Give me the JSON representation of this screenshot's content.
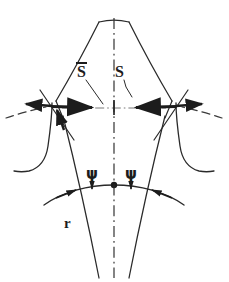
{
  "figure": {
    "kind": "engineering-line-drawing",
    "background_color": "#ffffff",
    "ink_color": "#1c1c1c",
    "width": 229,
    "height": 282
  },
  "labels": {
    "s_bar": "S",
    "s_bar_has_overbar": true,
    "s": "S",
    "radius": "r",
    "psi_left": "ψ",
    "psi_right": "ψ"
  },
  "annotations": [
    {
      "name": "s-bar-dimension",
      "symbol": "S̄",
      "side": "left",
      "description": "Tooth thickness measured left of centerline"
    },
    {
      "name": "s-dimension",
      "symbol": "S",
      "side": "right",
      "description": "Tooth thickness measured right of centerline"
    },
    {
      "name": "psi-angle-left",
      "symbol": "ψ",
      "side": "left",
      "description": "Angle marker at pitch arc, left of centerline"
    },
    {
      "name": "psi-angle-right",
      "symbol": "ψ",
      "side": "right",
      "description": "Angle marker at pitch arc, right of centerline"
    },
    {
      "name": "radius-label",
      "symbol": "r",
      "side": "left",
      "description": "Radius reference on lower flank"
    }
  ],
  "geometry": {
    "centerline_style": "dash-dot",
    "centerline_x": 114,
    "centerline_top": 18,
    "centerline_bottom": 278,
    "apex_y": 22,
    "dimension_line_y": 108,
    "pitch_arc_y": 186,
    "center_dot": {
      "x": 114,
      "y": 185,
      "r": 3.2
    },
    "crossing_left": {
      "x": 52,
      "y": 106
    },
    "crossing_right": {
      "x": 176,
      "y": 106
    }
  }
}
